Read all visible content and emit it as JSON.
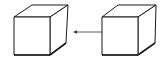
{
  "diagram": {
    "stroke_color": "#1a1a1a",
    "background": "#ffffff",
    "shapes": [
      {
        "id": "cube-left",
        "type": "cube"
      },
      {
        "id": "cube-right",
        "type": "cube"
      }
    ],
    "connectors": [
      {
        "from": "cube-right",
        "to": "cube-left",
        "type": "arrow"
      }
    ]
  }
}
